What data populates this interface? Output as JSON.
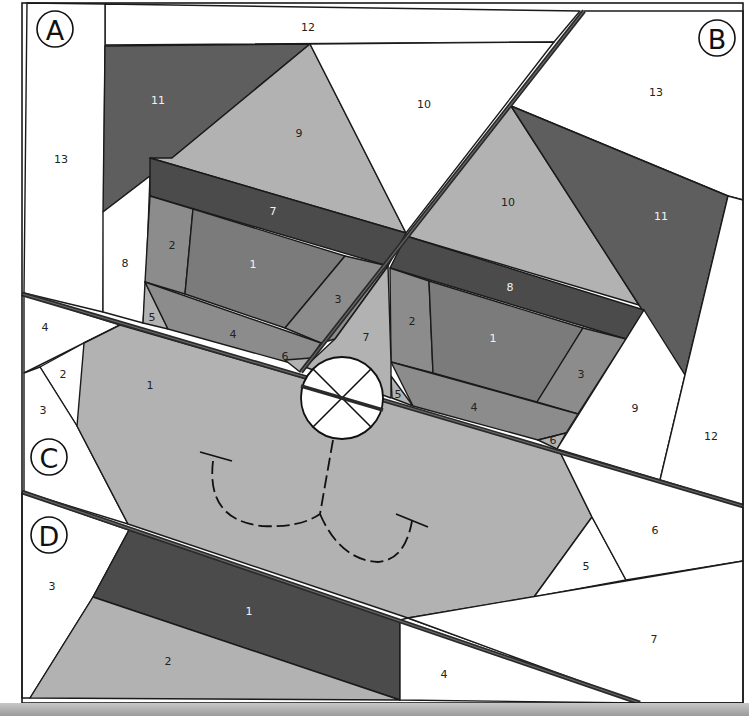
{
  "diagram": {
    "type": "paper-piecing-pattern",
    "colors": {
      "white": "#ffffff",
      "darkest": "#4b4b4b",
      "dark": "#5e5e5e",
      "medium": "#7b7b7b",
      "medium_light": "#8c8c8c",
      "light": "#b2b2b2",
      "label_dark": "#222222",
      "label_light": "#f2f2f2"
    },
    "sections": [
      {
        "id": "A",
        "label": "A",
        "badge": {
          "cx": 55,
          "cy": 29,
          "r": 18
        }
      },
      {
        "id": "B",
        "label": "B",
        "badge": {
          "cx": 717,
          "cy": 38,
          "r": 18
        }
      },
      {
        "id": "C",
        "label": "C",
        "badge": {
          "cx": 49,
          "cy": 457,
          "r": 18
        }
      },
      {
        "id": "D",
        "label": "D",
        "badge": {
          "cx": 49,
          "cy": 535,
          "r": 18
        }
      }
    ],
    "pieces": [
      {
        "section": "A",
        "number": "12",
        "fill": "white",
        "label_color": "dark",
        "points": "105,4 580,11 554,42 105,45",
        "lx": 308,
        "ly": 28
      },
      {
        "section": "A",
        "number": "13",
        "fill": "white",
        "label_color": "dark",
        "points": "27,3 105,4 105,45 103,312 24,293",
        "lx": 61,
        "ly": 160
      },
      {
        "section": "A",
        "number": "11",
        "fill": "dark",
        "label_color": "light",
        "points": "105,46 310,44 172,158 150,176 103,212",
        "lx": 158,
        "ly": 101
      },
      {
        "section": "A",
        "number": "9",
        "fill": "light",
        "label_color": "dark",
        "points": "310,44 406,233 150,158 172,158",
        "lx": 299,
        "ly": 134
      },
      {
        "section": "A",
        "number": "10",
        "fill": "white",
        "label_color": "dark",
        "points": "310,44 554,42 406,233",
        "lx": 424,
        "ly": 105
      },
      {
        "section": "A",
        "number": "8",
        "fill": "white",
        "label_color": "dark",
        "points": "103,212 150,176 146,282 143,323 103,312",
        "lx": 125,
        "ly": 264
      },
      {
        "section": "A",
        "number": "7",
        "fill": "darkest",
        "label_color": "light",
        "points": "150,158 406,233 388,266 150,196",
        "lx": 273,
        "ly": 212
      },
      {
        "section": "A",
        "number": "2",
        "fill": "medium_light",
        "label_color": "dark",
        "points": "150,196 193,209 185,294 145,282",
        "lx": 172,
        "ly": 246
      },
      {
        "section": "A",
        "number": "1",
        "fill": "medium",
        "label_color": "light",
        "points": "193,209 345,256 285,328 185,294",
        "lx": 253,
        "ly": 265
      },
      {
        "section": "A",
        "number": "3",
        "fill": "medium_light",
        "label_color": "dark",
        "points": "345,256 388,266 335,339 321,343 285,328",
        "lx": 338,
        "ly": 300
      },
      {
        "section": "A",
        "number": "5",
        "fill": "light",
        "label_color": "dark",
        "points": "145,282 168,329 143,323",
        "lx": 152,
        "ly": 318
      },
      {
        "section": "A",
        "number": "4",
        "fill": "medium_light",
        "label_color": "dark",
        "points": "145,282 321,343 305,367 168,329",
        "lx": 233,
        "ly": 335
      },
      {
        "section": "A",
        "number": "6",
        "fill": "light",
        "label_color": "dark",
        "points": "285,360 311,358 300,372",
        "lx": 285,
        "ly": 357
      },
      {
        "section": "B",
        "number": "13",
        "fill": "white",
        "label_color": "dark",
        "points": "584,11 743,11 743,200 728,196 511,106",
        "lx": 656,
        "ly": 93
      },
      {
        "section": "B",
        "number": "10",
        "fill": "light",
        "label_color": "dark",
        "points": "511,106 639,305 406,236",
        "lx": 508,
        "ly": 203
      },
      {
        "section": "B",
        "number": "11",
        "fill": "dark",
        "label_color": "light",
        "points": "511,106 728,196 685,375 639,305",
        "lx": 661,
        "ly": 217
      },
      {
        "section": "B",
        "number": "8",
        "fill": "darkest",
        "label_color": "light",
        "points": "406,236 644,310 626,339 390,268",
        "lx": 510,
        "ly": 288
      },
      {
        "section": "B",
        "number": "2",
        "fill": "medium_light",
        "label_color": "dark",
        "points": "390,268 429,281 433,373 391,362",
        "lx": 412,
        "ly": 322
      },
      {
        "section": "B",
        "number": "1",
        "fill": "medium",
        "label_color": "light",
        "points": "429,281 583,328 537,402 433,373",
        "lx": 493,
        "ly": 339
      },
      {
        "section": "B",
        "number": "3",
        "fill": "medium_light",
        "label_color": "dark",
        "points": "583,328 626,339 578,414 537,402",
        "lx": 581,
        "ly": 375
      },
      {
        "section": "B",
        "number": "5",
        "fill": "light",
        "label_color": "dark",
        "points": "391,376 413,406 392,398",
        "lx": 398,
        "ly": 395
      },
      {
        "section": "B",
        "number": "4",
        "fill": "medium_light",
        "label_color": "dark",
        "points": "391,362 578,414 566,433 538,440 413,406",
        "lx": 474,
        "ly": 408
      },
      {
        "section": "B",
        "number": "6",
        "fill": "light",
        "label_color": "dark",
        "points": "538,440 566,433 557,449",
        "lx": 553,
        "ly": 441
      },
      {
        "section": "B",
        "number": "9",
        "fill": "white",
        "label_color": "dark",
        "points": "626,339 644,310 685,375 660,480 557,449",
        "lx": 635,
        "ly": 409
      },
      {
        "section": "B",
        "number": "12",
        "fill": "white",
        "label_color": "dark",
        "points": "728,196 743,200 743,505 660,480 685,375",
        "lx": 711,
        "ly": 437
      },
      {
        "section": "B",
        "number": "7",
        "fill": "light",
        "label_color": "dark",
        "points": "335,339 388,266 391,362 391,398 305,367",
        "lx": 366,
        "ly": 338
      },
      {
        "section": "C",
        "number": "4",
        "fill": "white",
        "label_color": "dark",
        "points": "24,295 120,325 24,373",
        "lx": 45,
        "ly": 328
      },
      {
        "section": "C",
        "number": "2",
        "fill": "white",
        "label_color": "dark",
        "points": "84,343 118,327 77,426 40,367",
        "lx": 63,
        "ly": 375
      },
      {
        "section": "C",
        "number": "3",
        "fill": "white",
        "label_color": "dark",
        "points": "24,373 40,367 77,426 128,524 24,492",
        "lx": 43,
        "ly": 411
      },
      {
        "section": "C",
        "number": "1",
        "fill": "light",
        "label_color": "dark",
        "points": "120,325 560,452 592,517 534,597 408,618 128,524 77,426 84,343",
        "lx": 150,
        "ly": 386
      },
      {
        "section": "C",
        "number": "5",
        "fill": "white",
        "label_color": "dark",
        "points": "592,517 626,580 534,597",
        "lx": 586,
        "ly": 567
      },
      {
        "section": "C",
        "number": "6",
        "fill": "white",
        "label_color": "dark",
        "points": "560,452 743,507 743,561 626,580 592,517",
        "lx": 655,
        "ly": 531
      },
      {
        "section": "D",
        "number": "3",
        "fill": "white",
        "label_color": "dark",
        "points": "22,493 129,530 93,597 30,698 22,698",
        "lx": 52,
        "ly": 587
      },
      {
        "section": "D",
        "number": "1",
        "fill": "darkest",
        "label_color": "light",
        "points": "129,530 400,620 400,700 93,597",
        "lx": 249,
        "ly": 612
      },
      {
        "section": "D",
        "number": "2",
        "fill": "light",
        "label_color": "dark",
        "points": "93,597 400,700 30,698",
        "lx": 168,
        "ly": 662
      },
      {
        "section": "D",
        "number": "4",
        "fill": "white",
        "label_color": "dark",
        "points": "400,620 408,618 640,703 400,700",
        "lx": 444,
        "ly": 675
      },
      {
        "section": "D",
        "number": "7",
        "fill": "white",
        "label_color": "dark",
        "points": "408,618 743,561 743,703 640,703",
        "lx": 654,
        "ly": 640
      }
    ],
    "section_lines": [
      {
        "name": "seam-a-b",
        "x1": 301,
        "y1": 372,
        "x2": 584,
        "y2": 11
      },
      {
        "name": "seam-ab-c",
        "x1": 22,
        "y1": 294,
        "x2": 743,
        "y2": 506
      },
      {
        "name": "seam-c-d",
        "x1": 22,
        "y1": 492,
        "x2": 640,
        "y2": 703
      }
    ],
    "nose": {
      "cx": 342,
      "cy": 398,
      "r": 41,
      "label": "nose-appliqué"
    },
    "mouth": {
      "left_path": "M 213 461 Q 206 520 262 526 Q 300 528 320 514",
      "right_path": "M 320 514 Q 340 560 378 562 Q 405 560 412 521",
      "philtrum_path": "M 333 440 L 320 514",
      "left_tick": {
        "x1": 200,
        "y1": 452,
        "x2": 232,
        "y2": 461
      },
      "right_tick": {
        "x1": 396,
        "y1": 514,
        "x2": 428,
        "y2": 527
      }
    },
    "frame": {
      "x": 22,
      "y": 3,
      "width": 721,
      "height": 700
    }
  }
}
